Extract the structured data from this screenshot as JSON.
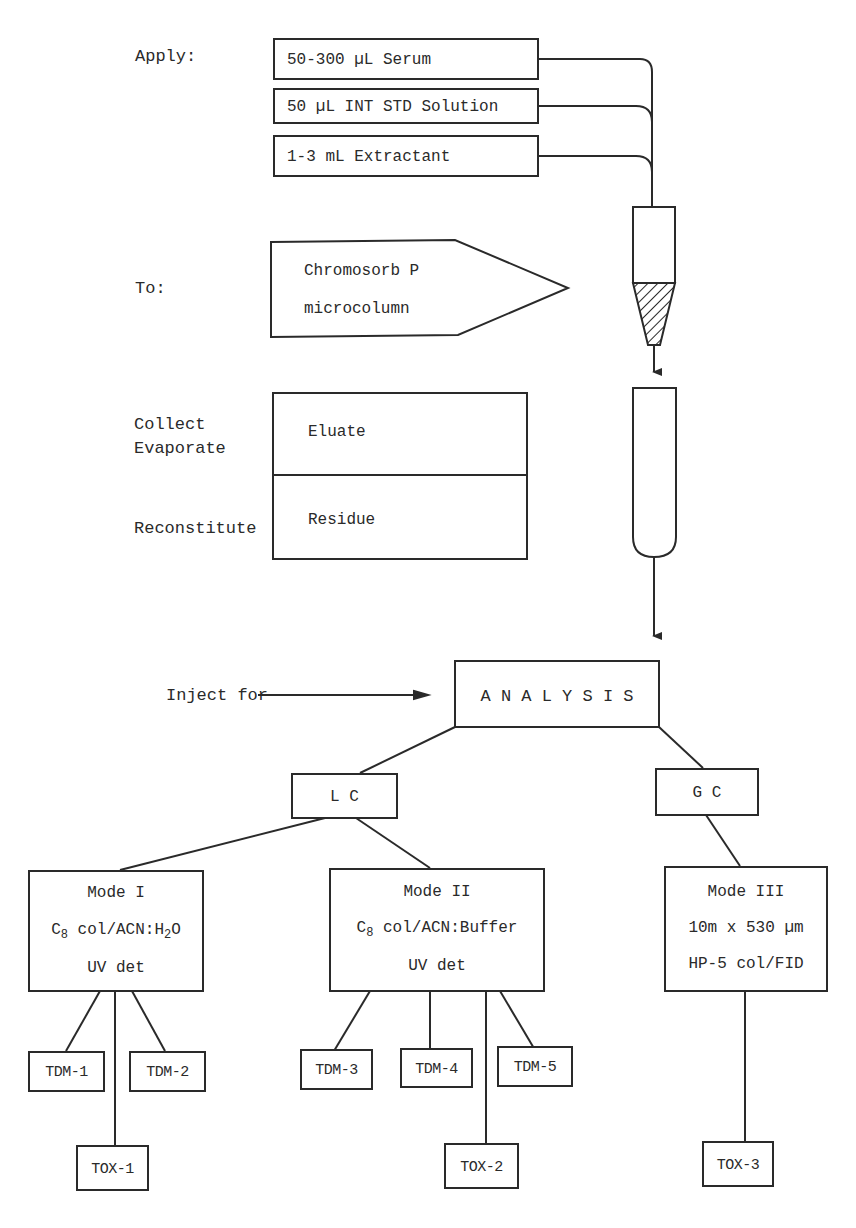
{
  "header_fragment": "",
  "steps": {
    "apply_label": "Apply:",
    "apply_items": [
      "50-300 µL Serum",
      "50 µL INT STD Solution",
      "1-3 mL Extractant"
    ],
    "to_label": "To:",
    "to_box": [
      "Chromosorb P",
      "microcolumn"
    ],
    "collect_label": "Collect",
    "evaporate_label": "Evaporate",
    "reconstitute_label": "Reconstitute",
    "eluate_label": "Eluate",
    "residue_label": "Residue",
    "inject_label": "Inject for"
  },
  "analysis": {
    "title": "A N A L Y S I S",
    "lc": "L C",
    "gc": "G C",
    "modes": [
      {
        "name": "Mode I",
        "line2_main": "C",
        "line2_sub": "8",
        "line2_rest": " col/ACN:H",
        "line2_sub2": "2",
        "line2_end": "O",
        "line3": "UV det"
      },
      {
        "name": "Mode II",
        "line2_main": "C",
        "line2_sub": "8",
        "line2_rest": " col/ACN:Buffer",
        "line3": "UV det"
      },
      {
        "name": "Mode III",
        "line2": "10m x 530 µm",
        "line3": "HP-5 col/FID"
      }
    ],
    "leaves": {
      "tdm1": "TDM-1",
      "tdm2": "TDM-2",
      "tdm3": "TDM-3",
      "tdm4": "TDM-4",
      "tdm5": "TDM-5",
      "tox1": "TOX-1",
      "tox2": "TOX-2",
      "tox3": "TOX-3"
    }
  },
  "colors": {
    "ink": "#2a2a2a",
    "background": "#ffffff"
  }
}
